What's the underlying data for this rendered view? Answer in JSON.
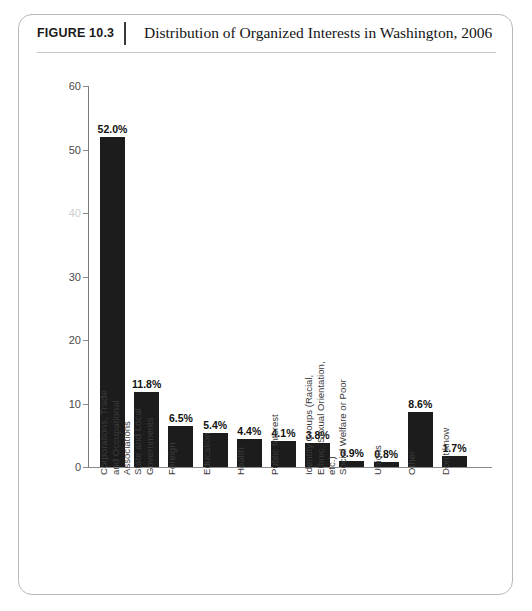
{
  "header": {
    "figure_number": "FIGURE 10.3",
    "title": "Distribution of Organized Interests in Washington, 2006"
  },
  "colors": {
    "bar_fill": "#1c1c1c",
    "axis": "#8a8a8a",
    "panel_border": "#b8b8b8",
    "value_label": "#111111",
    "tick_label": "#4a4a4a",
    "background": "#ffffff"
  },
  "chart_data": {
    "type": "bar",
    "title": "Distribution of Organized Interests in Washington, 2006",
    "xlabel": "",
    "ylabel": "",
    "ylim": [
      0,
      60
    ],
    "yticks": [
      0,
      10,
      20,
      30,
      40,
      50,
      60
    ],
    "ytick_labels": [
      "0",
      "10",
      "20",
      "30",
      "40",
      "50",
      "60"
    ],
    "grid": false,
    "legend": "none",
    "orientation": "vertical",
    "categories": [
      "Corporations, Trade\nand Occupational\nAssociations",
      "State and Local\nGovernments",
      "Foreign",
      "Education",
      "Health",
      "Public Interest",
      "Identity Groups (Racial,\nEthnic, Sexual Orientation,\netc.)",
      "Social Welfare or Poor",
      "Unions",
      "Other",
      "Don't know"
    ],
    "values": [
      52.0,
      11.8,
      6.5,
      5.4,
      4.4,
      4.1,
      3.8,
      0.9,
      0.8,
      8.6,
      1.7
    ],
    "data_labels": [
      "52.0%",
      "11.8%",
      "6.5%",
      "5.4%",
      "4.4%",
      "4.1%",
      "3.8%",
      "0.9%",
      "0.8%",
      "8.6%",
      "1.7%"
    ],
    "unit": "%"
  }
}
